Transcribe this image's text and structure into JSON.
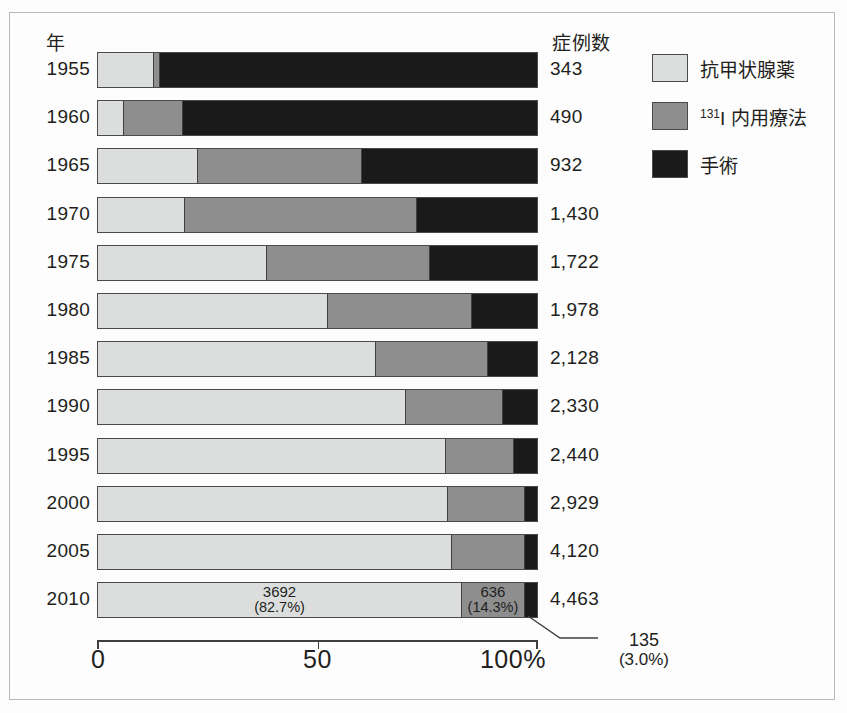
{
  "headers": {
    "year": "年",
    "cases": "症例数"
  },
  "legend": {
    "position": "right",
    "items": [
      {
        "key": "drug",
        "label": "抗甲状腺薬",
        "color": "#dcdedd"
      },
      {
        "key": "iodine",
        "label_sup": "131",
        "label_main": "I 内用療法",
        "color": "#8e8e8e"
      },
      {
        "key": "surgery",
        "label": "手術",
        "color": "#1a1a1a"
      }
    ]
  },
  "axis": {
    "ticks": [
      "0",
      "50",
      "100%"
    ],
    "tick_values": [
      0,
      50,
      100
    ],
    "min": 0,
    "max": 100
  },
  "callout": {
    "value": "135",
    "percent": "(3.0%)"
  },
  "labels_2010": {
    "drug_value": "3692",
    "drug_percent": "(82.7%)",
    "iodine_value": "636",
    "iodine_percent": "(14.3%)"
  },
  "chart_data": {
    "type": "bar",
    "orientation": "horizontal",
    "stacked": true,
    "normalized": true,
    "title": "",
    "xlabel": "",
    "ylabel": "年",
    "xlim": [
      0,
      100
    ],
    "grid": false,
    "legend_position": "right",
    "categories": [
      "1955",
      "1960",
      "1965",
      "1970",
      "1975",
      "1980",
      "1985",
      "1990",
      "1995",
      "2000",
      "2005",
      "2010"
    ],
    "case_totals": [
      "343",
      "490",
      "932",
      "1,430",
      "1,722",
      "1,978",
      "2,128",
      "2,330",
      "2,440",
      "2,929",
      "4,120",
      "4,463"
    ],
    "series": [
      {
        "name": "抗甲状腺薬",
        "color": "#dcdedd",
        "values": [
          12.5,
          5.7,
          22.5,
          19.5,
          38.3,
          52.2,
          63.0,
          70.0,
          79.0,
          79.4,
          80.5,
          82.7
        ]
      },
      {
        "name": "131I 内用療法",
        "color": "#8e8e8e",
        "values": [
          1.3,
          13.5,
          37.5,
          53.0,
          37.2,
          32.8,
          25.5,
          22.0,
          15.5,
          17.6,
          16.5,
          14.3
        ]
      },
      {
        "name": "手術",
        "color": "#1a1a1a",
        "values": [
          86.2,
          80.8,
          40.0,
          27.5,
          24.5,
          15.0,
          11.5,
          8.0,
          5.5,
          3.0,
          3.0,
          3.0
        ]
      }
    ],
    "rows": [
      {
        "year": "1955",
        "cases": "343",
        "drug": 12.5,
        "iodine": 1.3,
        "surgery": 86.2
      },
      {
        "year": "1960",
        "cases": "490",
        "drug": 5.7,
        "iodine": 13.5,
        "surgery": 80.8
      },
      {
        "year": "1965",
        "cases": "932",
        "drug": 22.5,
        "iodine": 37.5,
        "surgery": 40.0
      },
      {
        "year": "1970",
        "cases": "1,430",
        "drug": 19.5,
        "iodine": 53.0,
        "surgery": 27.5
      },
      {
        "year": "1975",
        "cases": "1,722",
        "drug": 38.3,
        "iodine": 37.2,
        "surgery": 24.5
      },
      {
        "year": "1980",
        "cases": "1,978",
        "drug": 52.2,
        "iodine": 32.8,
        "surgery": 15.0
      },
      {
        "year": "1985",
        "cases": "2,128",
        "drug": 63.0,
        "iodine": 25.5,
        "surgery": 11.5
      },
      {
        "year": "1990",
        "cases": "2,330",
        "drug": 70.0,
        "iodine": 22.0,
        "surgery": 8.0
      },
      {
        "year": "1995",
        "cases": "2,440",
        "drug": 79.0,
        "iodine": 15.5,
        "surgery": 5.5
      },
      {
        "year": "2000",
        "cases": "2,929",
        "drug": 79.4,
        "iodine": 17.6,
        "surgery": 3.0
      },
      {
        "year": "2005",
        "cases": "4,120",
        "drug": 80.5,
        "iodine": 16.5,
        "surgery": 3.0
      },
      {
        "year": "2010",
        "cases": "4,463",
        "drug": 82.7,
        "iodine": 14.3,
        "surgery": 3.0
      }
    ]
  }
}
